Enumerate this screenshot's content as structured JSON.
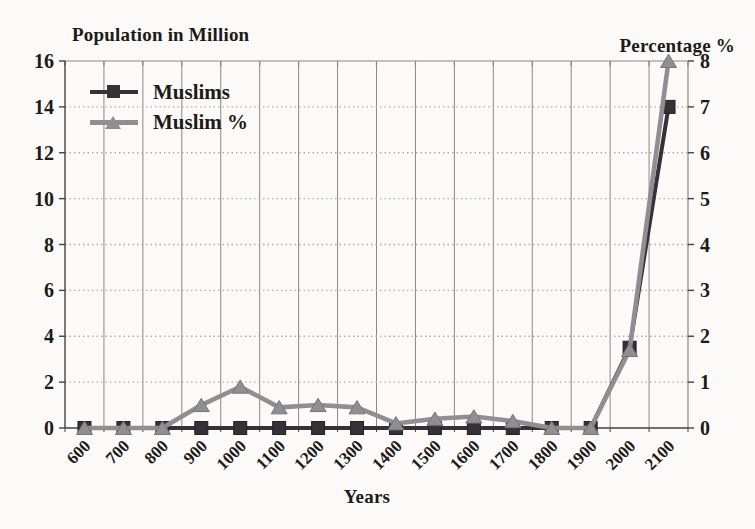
{
  "figure": {
    "left_axis_title": "Population in Million",
    "right_axis_title": "Percentage %",
    "x_axis_title": "Years"
  },
  "chart_data": {
    "type": "line",
    "categories": [
      "600",
      "700",
      "800",
      "900",
      "1000",
      "1100",
      "1200",
      "1300",
      "1400",
      "1500",
      "1600",
      "1700",
      "1800",
      "1900",
      "2000",
      "2100"
    ],
    "series": [
      {
        "name": "Muslims",
        "axis": "left",
        "marker": "square",
        "color": "#343238",
        "marker_stroke": "#232126",
        "values": [
          0,
          0,
          0,
          0,
          0,
          0,
          0,
          0,
          0,
          0,
          0,
          0,
          0,
          0,
          3.5,
          14
        ]
      },
      {
        "name": "Muslim %",
        "axis": "right",
        "marker": "triangle",
        "color": "#8f8e91",
        "marker_stroke": "#76757a",
        "values": [
          0,
          0,
          0,
          0.5,
          0.9,
          0.45,
          0.5,
          0.45,
          0.1,
          0.2,
          0.25,
          0.15,
          0,
          0,
          1.7,
          8
        ]
      }
    ],
    "left_axis": {
      "min": 0,
      "max": 16,
      "step": 2,
      "ticks": [
        "0",
        "2",
        "4",
        "6",
        "8",
        "10",
        "12",
        "14",
        "16"
      ]
    },
    "right_axis": {
      "min": 0,
      "max": 8,
      "step": 1,
      "ticks": [
        "0",
        "1",
        "2",
        "3",
        "4",
        "5",
        "6",
        "7",
        "8"
      ]
    },
    "xlabel": "Years",
    "left_ylabel": "Population in Million",
    "right_ylabel": "Percentage %",
    "grid": true,
    "legend_position": "top-left-inside",
    "colors": {
      "paper": "#fbfaf8",
      "ink": "#1d1b18",
      "grid_vertical": "#8d887f",
      "grid_dotted": "#b3ada3",
      "axis_line": "#46433d"
    }
  }
}
